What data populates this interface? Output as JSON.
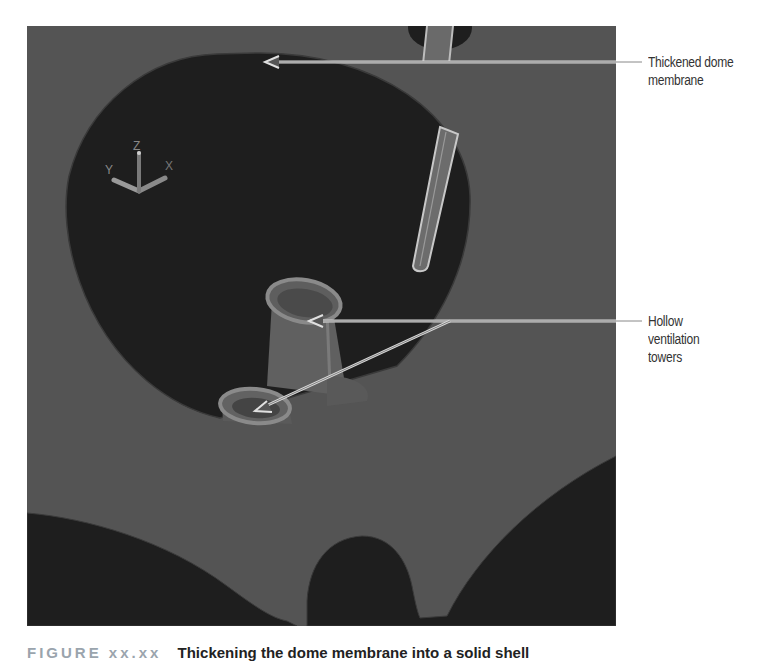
{
  "figure": {
    "viewport": {
      "background_color": "#545454",
      "cutout_color": "#1e1e1e",
      "ucs_icon": {
        "axes": [
          "X",
          "Y",
          "Z"
        ]
      }
    },
    "callouts": [
      {
        "id": "dome",
        "lines": [
          "Thickened dome",
          "membrane"
        ]
      },
      {
        "id": "towers",
        "lines": [
          "Hollow",
          "ventilation",
          "towers"
        ]
      }
    ],
    "caption": {
      "number": "FIGURE xx.xx",
      "text": "Thickening the dome membrane into a solid shell"
    }
  }
}
